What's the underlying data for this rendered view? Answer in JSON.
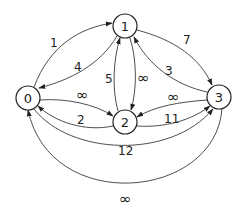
{
  "diagram": {
    "type": "directed-weighted-graph",
    "nodes": [
      {
        "id": "0",
        "label": "0",
        "x": 28,
        "y": 98
      },
      {
        "id": "1",
        "label": "1",
        "x": 125,
        "y": 26
      },
      {
        "id": "2",
        "label": "2",
        "x": 125,
        "y": 122
      },
      {
        "id": "3",
        "label": "3",
        "x": 219,
        "y": 97
      }
    ],
    "edges": [
      {
        "from": "0",
        "to": "1",
        "weight": "1"
      },
      {
        "from": "1",
        "to": "0",
        "weight": "4"
      },
      {
        "from": "1",
        "to": "3",
        "weight": "7"
      },
      {
        "from": "3",
        "to": "1",
        "weight": "3"
      },
      {
        "from": "2",
        "to": "1",
        "weight": "5"
      },
      {
        "from": "1",
        "to": "2",
        "weight": "∞"
      },
      {
        "from": "0",
        "to": "2",
        "weight": "∞"
      },
      {
        "from": "2",
        "to": "0",
        "weight": "2"
      },
      {
        "from": "3",
        "to": "2",
        "weight": "∞"
      },
      {
        "from": "2",
        "to": "3",
        "weight": "11"
      },
      {
        "from": "0",
        "to": "3",
        "weight": "12"
      },
      {
        "from": "3",
        "to": "0",
        "weight": "∞"
      }
    ]
  },
  "labels": {
    "n0": "0",
    "n1": "1",
    "n2": "2",
    "n3": "3",
    "e01": "1",
    "e10": "4",
    "e13": "7",
    "e31": "3",
    "e21": "5",
    "e12": "∞",
    "e02": "∞",
    "e20": "2",
    "e32": "∞",
    "e23": "11",
    "e03": "12",
    "e30": "∞"
  }
}
